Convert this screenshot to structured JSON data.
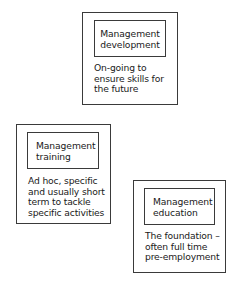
{
  "diagram": {
    "cards": [
      {
        "title": "Management\ndevelopment",
        "description": "On-going to\nensure skills for\nthe future"
      },
      {
        "title": "Management\ntraining",
        "description": "Ad hoc, specific\nand usually short\nterm to tackle\nspecific activities"
      },
      {
        "title": "Management\neducation",
        "description": "The foundation –\noften full time\npre-employment"
      }
    ],
    "colors": {
      "border": "#3a3a3a",
      "text": "#1a1a1a",
      "background": "#ffffff"
    }
  }
}
